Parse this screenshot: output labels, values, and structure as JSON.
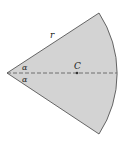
{
  "diagram": {
    "type": "circular-sector",
    "labels": {
      "radius": "r",
      "angle_top": "α",
      "angle_bottom": "α",
      "centroid": "C"
    },
    "colors": {
      "fill": "#d3d3d3",
      "stroke": "#444444",
      "axis": "#555555"
    }
  }
}
